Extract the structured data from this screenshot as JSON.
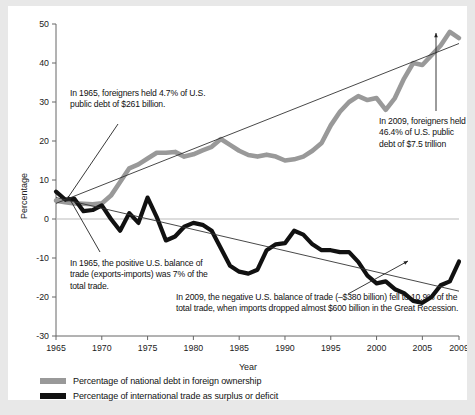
{
  "figure": {
    "background": "#e8e8e8",
    "card_background": "#ffffff"
  },
  "axes": {
    "ylabel": "Percentage",
    "xlabel": "Year",
    "yticks": [
      "50",
      "40",
      "30",
      "20",
      "10",
      "0",
      "-10",
      "-20",
      "-30"
    ],
    "xticks": [
      "1965",
      "1970",
      "1975",
      "1980",
      "1985",
      "1990",
      "1995",
      "2000",
      "2005",
      "2009"
    ]
  },
  "annotations": {
    "debt_1965": "In 1965, foreigners held 4.7% of U.S. public debt of $261 billion.",
    "debt_2009": "In 2009, foreigners held 46.4% of U.S. public debt of $7.5 trillion",
    "trade_1965": "In 1965, the positive U.S. balance of trade (exports-imports) was 7% of the total trade.",
    "trade_2009": "In 2009, the negative U.S. balance of trade (–$380 billion) fell to 10.9% of the total trade, when imports dropped almost $600 billion in the Great Recession."
  },
  "legend": {
    "items": [
      {
        "label": "Percentage of national debt in foreign ownership",
        "color": "#999999",
        "swatch": "sw-gray"
      },
      {
        "label": "Percentage of international trade as surplus or deficit",
        "color": "#111111",
        "swatch": "sw-black"
      }
    ]
  },
  "chart_data": {
    "type": "line",
    "title": "",
    "xlabel": "Year",
    "ylabel": "Percentage",
    "xlim": [
      1965,
      2009
    ],
    "ylim": [
      -30,
      50
    ],
    "grid": false,
    "legend_position": "bottom-left",
    "series": [
      {
        "name": "Percentage of national debt in foreign ownership",
        "color": "#999999",
        "linewidth": 4.6,
        "x": [
          1965,
          1966,
          1967,
          1968,
          1969,
          1970,
          1971,
          1972,
          1973,
          1974,
          1975,
          1976,
          1977,
          1978,
          1979,
          1980,
          1981,
          1982,
          1983,
          1984,
          1985,
          1986,
          1987,
          1988,
          1989,
          1990,
          1991,
          1992,
          1993,
          1994,
          1995,
          1996,
          1997,
          1998,
          1999,
          2000,
          2001,
          2002,
          2003,
          2004,
          2005,
          2006,
          2007,
          2008,
          2009
        ],
        "y": [
          4.7,
          4.3,
          4.0,
          3.9,
          3.8,
          4.0,
          6.0,
          9.5,
          13.0,
          14.0,
          15.5,
          17.0,
          17.0,
          17.2,
          16.0,
          16.6,
          17.6,
          18.5,
          20.5,
          19.0,
          17.5,
          16.4,
          16.0,
          16.5,
          16.0,
          15.0,
          15.3,
          16.0,
          17.5,
          19.5,
          24.0,
          27.5,
          30.0,
          31.5,
          30.5,
          31.0,
          28.0,
          31.0,
          36.0,
          40.0,
          39.5,
          42.0,
          44.5,
          48.0,
          46.4
        ]
      },
      {
        "name": "Percentage of international trade as surplus or deficit",
        "color": "#111111",
        "linewidth": 4.2,
        "x": [
          1965,
          1966,
          1967,
          1968,
          1969,
          1970,
          1971,
          1972,
          1973,
          1974,
          1975,
          1976,
          1977,
          1978,
          1979,
          1980,
          1981,
          1982,
          1983,
          1984,
          1985,
          1986,
          1987,
          1988,
          1989,
          1990,
          1991,
          1992,
          1993,
          1994,
          1995,
          1996,
          1997,
          1998,
          1999,
          2000,
          2001,
          2002,
          2003,
          2004,
          2005,
          2006,
          2007,
          2008,
          2009
        ],
        "y": [
          7.0,
          5.0,
          5.2,
          2.0,
          2.3,
          3.5,
          0.0,
          -3.0,
          1.5,
          -1.0,
          5.5,
          0.5,
          -5.5,
          -4.5,
          -2.0,
          -1.0,
          -1.5,
          -3.0,
          -7.5,
          -12.0,
          -13.5,
          -14.0,
          -13.0,
          -8.0,
          -6.5,
          -6.2,
          -3.0,
          -4.0,
          -6.5,
          -8.0,
          -8.0,
          -8.5,
          -8.5,
          -11.0,
          -14.5,
          -16.5,
          -16.0,
          -18.0,
          -19.0,
          -21.0,
          -21.5,
          -20.0,
          -17.0,
          -16.0,
          -10.9
        ]
      }
    ],
    "trendlines": [
      {
        "name": "debt-trend",
        "x": [
          1965,
          2009
        ],
        "y": [
          4.0,
          45.0
        ],
        "color": "#333333"
      },
      {
        "name": "trade-trend",
        "x": [
          1965,
          2009
        ],
        "y": [
          5.5,
          -18.5
        ],
        "color": "#333333"
      }
    ]
  }
}
